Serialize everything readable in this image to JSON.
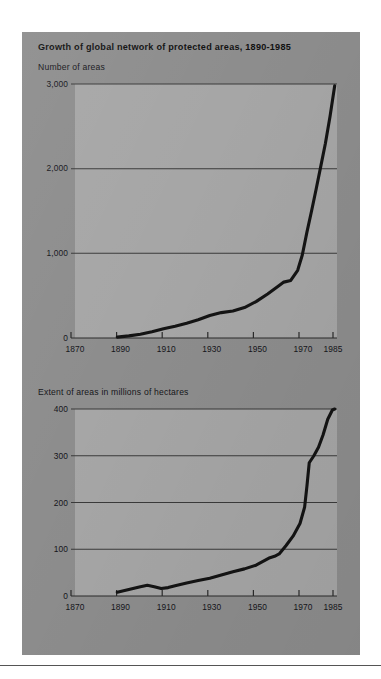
{
  "figure": {
    "title": "Growth of global network of protected areas, 1890-1985",
    "panel_color": "#8d8d8d",
    "plot_color": "#a6a6a6",
    "line_color": "#141414",
    "grid_color": "#3a3a3a"
  },
  "chart_data": [
    {
      "type": "line",
      "title": "Number of areas",
      "subtitle": "Growth of global network of protected areas, 1890-1985",
      "xlabel": "",
      "ylabel": "Number of areas",
      "xlim": [
        1870,
        1985
      ],
      "ylim": [
        0,
        3000
      ],
      "xticks": [
        1870,
        1890,
        1910,
        1930,
        1950,
        1970,
        1985
      ],
      "xtick_labels": [
        "1870",
        "1890",
        "1910",
        "1930",
        "1950",
        "1970",
        "1985"
      ],
      "yticks": [
        0,
        1000,
        2000,
        3000
      ],
      "ytick_labels": [
        "0",
        "1,000",
        "2,000",
        "3,000"
      ],
      "grid": "horizontal",
      "legend": "none",
      "x": [
        1890,
        1895,
        1900,
        1905,
        1910,
        1915,
        1920,
        1925,
        1930,
        1935,
        1940,
        1945,
        1950,
        1955,
        1960,
        1962,
        1965,
        1968,
        1970,
        1972,
        1974,
        1976,
        1978,
        1980,
        1982,
        1984
      ],
      "values": [
        10,
        25,
        45,
        75,
        110,
        140,
        175,
        215,
        265,
        300,
        320,
        360,
        430,
        520,
        620,
        660,
        680,
        800,
        980,
        1250,
        1500,
        1760,
        2030,
        2300,
        2620,
        2980
      ]
    },
    {
      "type": "line",
      "title": "Extent of areas in millions of hectares",
      "xlabel": "",
      "ylabel": "Extent of areas in millions of hectares",
      "xlim": [
        1870,
        1985
      ],
      "ylim": [
        0,
        400
      ],
      "xticks": [
        1870,
        1890,
        1910,
        1930,
        1950,
        1970,
        1985
      ],
      "xtick_labels": [
        "1870",
        "1890",
        "1910",
        "1930",
        "1950",
        "1970",
        "1985"
      ],
      "yticks": [
        0,
        100,
        200,
        300,
        400
      ],
      "ytick_labels": [
        "0",
        "100",
        "200",
        "300",
        "400"
      ],
      "grid": "horizontal",
      "legend": "none",
      "x": [
        1890,
        1895,
        1900,
        1903,
        1906,
        1909,
        1912,
        1915,
        1920,
        1925,
        1930,
        1935,
        1940,
        1945,
        1950,
        1953,
        1956,
        1958,
        1960,
        1963,
        1966,
        1969,
        1971,
        1972,
        1973,
        1975,
        1977,
        1979,
        1981,
        1983,
        1984
      ],
      "values": [
        8,
        14,
        20,
        23,
        20,
        16,
        18,
        22,
        28,
        33,
        38,
        45,
        52,
        58,
        66,
        74,
        82,
        85,
        90,
        108,
        128,
        155,
        190,
        235,
        285,
        300,
        318,
        345,
        378,
        398,
        400
      ]
    }
  ],
  "footer": {
    "rule_color": "#555555"
  }
}
